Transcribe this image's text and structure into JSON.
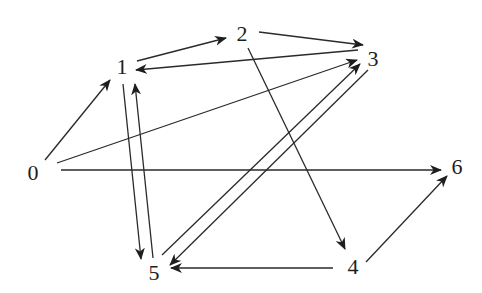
{
  "diagram": {
    "type": "directed-graph",
    "background": "#ffffff",
    "stroke_color": "#2a2a2a",
    "label_color": "#1e1e1e",
    "nodes": [
      {
        "id": "0",
        "label": "0",
        "x": 33,
        "y": 172
      },
      {
        "id": "1",
        "label": "1",
        "x": 122,
        "y": 66
      },
      {
        "id": "2",
        "label": "2",
        "x": 242,
        "y": 33
      },
      {
        "id": "3",
        "label": "3",
        "x": 373,
        "y": 58
      },
      {
        "id": "4",
        "label": "4",
        "x": 353,
        "y": 266
      },
      {
        "id": "5",
        "label": "5",
        "x": 154,
        "y": 272
      },
      {
        "id": "6",
        "label": "6",
        "x": 457,
        "y": 166
      }
    ],
    "edges": [
      {
        "from": "0",
        "to": "1",
        "x1": 45,
        "y1": 160,
        "x2": 110,
        "y2": 80
      },
      {
        "from": "0",
        "to": "3",
        "x1": 57,
        "y1": 163,
        "x2": 357,
        "y2": 60
      },
      {
        "from": "0",
        "to": "6",
        "x1": 61,
        "y1": 170,
        "x2": 441,
        "y2": 170
      },
      {
        "from": "1",
        "to": "2",
        "x1": 137,
        "y1": 61,
        "x2": 226,
        "y2": 38
      },
      {
        "from": "3",
        "to": "1",
        "x1": 358,
        "y1": 50,
        "x2": 136,
        "y2": 70
      },
      {
        "from": "2",
        "to": "3",
        "x1": 259,
        "y1": 32,
        "x2": 363,
        "y2": 45
      },
      {
        "from": "2",
        "to": "4",
        "x1": 248,
        "y1": 48,
        "x2": 345,
        "y2": 249
      },
      {
        "from": "1",
        "to": "5",
        "x1": 123,
        "y1": 84,
        "x2": 141,
        "y2": 259
      },
      {
        "from": "5",
        "to": "1",
        "x1": 153,
        "y1": 258,
        "x2": 135,
        "y2": 84
      },
      {
        "from": "5",
        "to": "3",
        "x1": 162,
        "y1": 255,
        "x2": 360,
        "y2": 64
      },
      {
        "from": "3",
        "to": "5",
        "x1": 368,
        "y1": 70,
        "x2": 170,
        "y2": 265
      },
      {
        "from": "4",
        "to": "5",
        "x1": 333,
        "y1": 268,
        "x2": 171,
        "y2": 268
      },
      {
        "from": "4",
        "to": "6",
        "x1": 366,
        "y1": 262,
        "x2": 447,
        "y2": 176
      }
    ]
  }
}
